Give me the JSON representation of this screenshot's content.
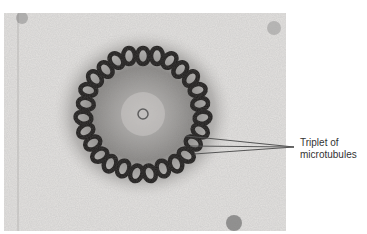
{
  "figure": {
    "annotation": {
      "line1": "Triplet of",
      "line2": "microtubules"
    },
    "colors": {
      "background": "#ffffff",
      "photo_base": "#e6e4e2",
      "leader_line": "#555555",
      "label_text": "#333333"
    }
  }
}
